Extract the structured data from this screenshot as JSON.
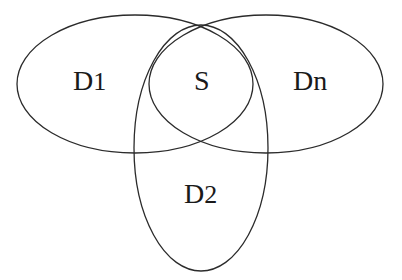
{
  "diagram": {
    "type": "venn",
    "sets": [
      {
        "id": "D1",
        "label": "D",
        "subscript": "1",
        "full_label": "D1",
        "shape": {
          "cx": 135,
          "cy": 84,
          "rx": 118,
          "ry": 69
        },
        "label_pos": {
          "x": 73,
          "y": 90
        }
      },
      {
        "id": "Dn",
        "label": "Dn",
        "full_label": "Dn",
        "shape": {
          "cx": 266,
          "cy": 84,
          "rx": 117,
          "ry": 69
        },
        "label_pos": {
          "x": 293,
          "y": 90
        }
      },
      {
        "id": "D2",
        "label": "D",
        "subscript": "2",
        "full_label": "D2",
        "shape": {
          "cx": 201,
          "cy": 148,
          "rx": 67,
          "ry": 123
        },
        "label_pos": {
          "x": 184,
          "y": 203
        }
      }
    ],
    "intersection": {
      "id": "S",
      "label": "S",
      "label_pos": {
        "x": 194,
        "y": 90
      }
    },
    "colors": {
      "stroke": "#2b2b2b",
      "text": "#1a1a1a",
      "background": "#ffffff"
    }
  }
}
